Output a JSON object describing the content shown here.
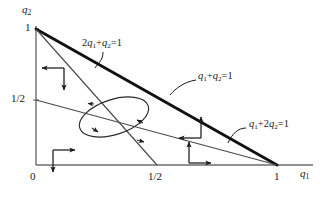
{
  "figure": {
    "type": "phase-diagram",
    "background": "#ffffff",
    "line_color": "#1a1a1a"
  },
  "axes": {
    "x_axis_label": "q₁",
    "y_axis_label": "q₂",
    "x_ticks": [
      {
        "value": 0,
        "label": "0"
      },
      {
        "value": 0.5,
        "label": "1/2"
      },
      {
        "value": 1,
        "label": "1"
      }
    ],
    "y_ticks": [
      {
        "value": 0.5,
        "label": "1/2"
      },
      {
        "value": 1,
        "label": "1"
      }
    ],
    "xlim": [
      0,
      1.2
    ],
    "ylim": [
      0,
      1.12
    ]
  },
  "lines": [
    {
      "id": "line-q1-plus-q2",
      "equation": "q₁+q₂=1",
      "label": "q₁+q₂=1",
      "weight": "thick",
      "from": [
        0,
        1
      ],
      "to": [
        1,
        0
      ]
    },
    {
      "id": "line-2q1-plus-q2",
      "equation": "2q₁+q₂=1",
      "label": "2q₁+q₂=1",
      "weight": "thin",
      "from": [
        0,
        1
      ],
      "to": [
        0.5,
        0
      ]
    },
    {
      "id": "line-q1-plus-2q2",
      "equation": "q₁+2q₂=1",
      "label": "q₁+2q₂=1",
      "weight": "thin",
      "from": [
        0,
        0.5
      ],
      "to": [
        1,
        0
      ]
    }
  ],
  "vector_field_markers": [
    {
      "id": "region-upper-left",
      "directions": [
        "left",
        "down"
      ]
    },
    {
      "id": "region-lower-left",
      "directions": [
        "right",
        "down"
      ]
    },
    {
      "id": "region-middle-right",
      "directions": [
        "left",
        "up"
      ]
    },
    {
      "id": "region-lower-right",
      "directions": [
        "up",
        "right"
      ]
    }
  ],
  "cycle": {
    "id": "limit-cycle",
    "shape": "ellipse",
    "orientation": "counterclockwise",
    "center": [
      0.42,
      0.41
    ],
    "arrowheads": 4
  }
}
